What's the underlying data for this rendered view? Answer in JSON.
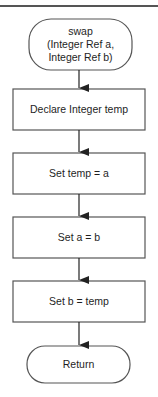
{
  "diagram": {
    "type": "flowchart",
    "colors": {
      "stroke": "#555555",
      "text": "#1e1e1e",
      "background": "#ffffff"
    },
    "nodes": [
      {
        "id": "start",
        "shape": "terminator",
        "label": "swap\n(Integer Ref a,\nInteger Ref b)"
      },
      {
        "id": "declare",
        "shape": "process",
        "label": "Declare Integer temp"
      },
      {
        "id": "set-temp",
        "shape": "process",
        "label": "Set temp = a"
      },
      {
        "id": "set-a",
        "shape": "process",
        "label": "Set a = b"
      },
      {
        "id": "set-b",
        "shape": "process",
        "label": "Set b = temp"
      },
      {
        "id": "return",
        "shape": "terminator",
        "label": "Return"
      }
    ],
    "edges": [
      {
        "from": "start",
        "to": "declare"
      },
      {
        "from": "declare",
        "to": "set-temp"
      },
      {
        "from": "set-temp",
        "to": "set-a"
      },
      {
        "from": "set-a",
        "to": "set-b"
      },
      {
        "from": "set-b",
        "to": "return"
      }
    ]
  }
}
